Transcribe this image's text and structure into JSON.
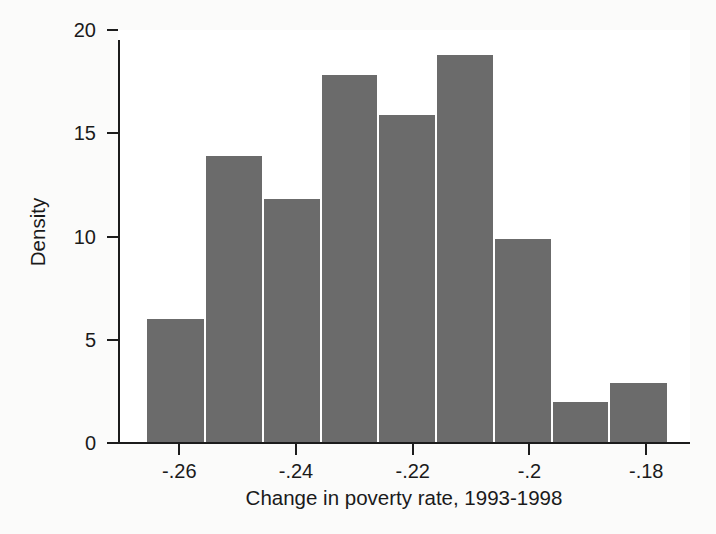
{
  "chart_data": {
    "type": "bar",
    "title": "",
    "subtitle": "",
    "xlabel": "Change in poverty rate, 1993-1998",
    "ylabel": "Density",
    "xlim": [
      -0.2705,
      -0.1725
    ],
    "ylim": [
      0,
      20
    ],
    "grid": false,
    "legend": null,
    "x_tick_labels": [
      "-.26",
      "-.24",
      "-.22",
      "-.2",
      "-.18"
    ],
    "x_tick_values": [
      -0.26,
      -0.24,
      -0.22,
      -0.2,
      -0.18
    ],
    "y_tick_labels": [
      "0",
      "5",
      "10",
      "15",
      "20"
    ],
    "y_tick_values": [
      0,
      5,
      10,
      15,
      20
    ],
    "bin_edges": [
      -0.2655,
      -0.2556,
      -0.2457,
      -0.2358,
      -0.2259,
      -0.216,
      -0.2061,
      -0.1962,
      -0.1863,
      -0.1764
    ],
    "categories": [
      "-.2655 to -.2556",
      "-.2556 to -.2457",
      "-.2457 to -.2358",
      "-.2358 to -.2259",
      "-.2259 to -.2160",
      "-.2160 to -.2061",
      "-.2061 to -.1962",
      "-.1962 to -.1863",
      "-.1863 to -.1764"
    ],
    "values": [
      6.0,
      13.9,
      11.8,
      17.8,
      15.9,
      18.8,
      9.9,
      2.0,
      2.9
    ],
    "bar_color": "#6b6b6b",
    "bar_edge_color": "#ffffff",
    "background_color": "#ffffff",
    "axis_color": "#1c1c1c"
  }
}
